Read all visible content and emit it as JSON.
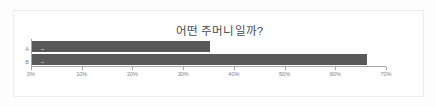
{
  "chart_data": {
    "type": "bar",
    "orientation": "horizontal",
    "title": "어떤 주머니일까?",
    "categories": [
      "A",
      "B"
    ],
    "values": [
      35,
      66
    ],
    "xlabel": "",
    "ylabel": "",
    "xlim": [
      0,
      70
    ],
    "xticks": [
      0,
      10,
      20,
      30,
      40,
      50,
      60,
      70
    ],
    "xtick_labels": [
      "0%",
      "10%",
      "20%",
      "30%",
      "40%",
      "50%",
      "60%",
      "70%"
    ],
    "grid": false,
    "legend": false,
    "bar_color": "#595959",
    "axis_color": "#a6a6a6",
    "tick_label_color": "#7f7f7f",
    "title_color": "#4a4a4a",
    "plot_background": "#ffffff"
  }
}
